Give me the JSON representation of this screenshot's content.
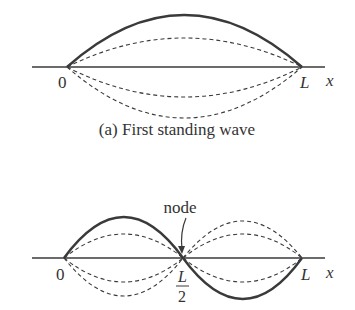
{
  "top_panel": {
    "caption": "(a) First standing wave",
    "origin_label": "0",
    "end_label": "L",
    "axis_label": "x"
  },
  "bottom_panel": {
    "node_label": "node",
    "origin_label": "0",
    "mid_label_num": "L",
    "mid_label_den": "2",
    "end_label": "L",
    "axis_label": "x"
  }
}
